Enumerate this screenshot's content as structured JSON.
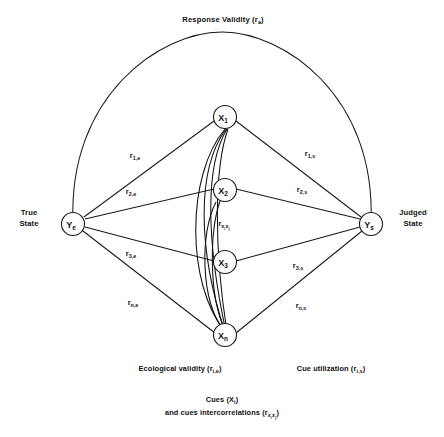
{
  "figure": {
    "type": "lens-model-diagram",
    "top_label": {
      "text": "Response Validity (r",
      "sub": "a",
      "close": ")"
    },
    "left_state": {
      "line1": "True",
      "line2": "State",
      "node_label": "Y",
      "node_sub": "e"
    },
    "right_state": {
      "line1": "Judged",
      "line2": "State",
      "node_label": "Y",
      "node_sub": "s"
    },
    "cues": [
      {
        "label": "X",
        "sub": "1",
        "name": "cue-node-x1"
      },
      {
        "label": "X",
        "sub": "2",
        "name": "cue-node-x2"
      },
      {
        "label": "X",
        "sub": "3",
        "name": "cue-node-x3"
      },
      {
        "label": "X",
        "sub": "n",
        "name": "cue-node-xn"
      }
    ],
    "left_edge_labels": [
      {
        "main": "r",
        "sub": "1,e"
      },
      {
        "main": "r",
        "sub": "2,e"
      },
      {
        "main": "r",
        "sub": "3,e"
      },
      {
        "main": "r",
        "sub": "n,e"
      }
    ],
    "right_edge_labels": [
      {
        "main": "r",
        "sub": "1,s"
      },
      {
        "main": "r",
        "sub": "2,s"
      },
      {
        "main": "r",
        "sub": "3,s"
      },
      {
        "main": "r",
        "sub": "n,s"
      }
    ],
    "intercorrelation_label": {
      "main": "r",
      "sub_x1": "x",
      "sub_i1": "i",
      "sub_x2": "x",
      "sub_i2": "j"
    },
    "bottom_left_caption": {
      "text": "Ecological validity (r",
      "sub": "i,e",
      "close": ")"
    },
    "bottom_right_caption": {
      "text": "Cue utilization (r",
      "sub": "i,s",
      "close": ")"
    },
    "bottom_caption_line1": {
      "text": "Cues (X",
      "sub": "i",
      "close": ")"
    },
    "bottom_caption_line2": {
      "text": "and cues intercorrelations (r",
      "sub_x1": "x",
      "sub_i1": "i",
      "sub_x2": "x",
      "sub_i2": "j",
      "close": ")"
    },
    "colors": {
      "ink": "#1a1a1a",
      "background": "#ffffff"
    }
  }
}
